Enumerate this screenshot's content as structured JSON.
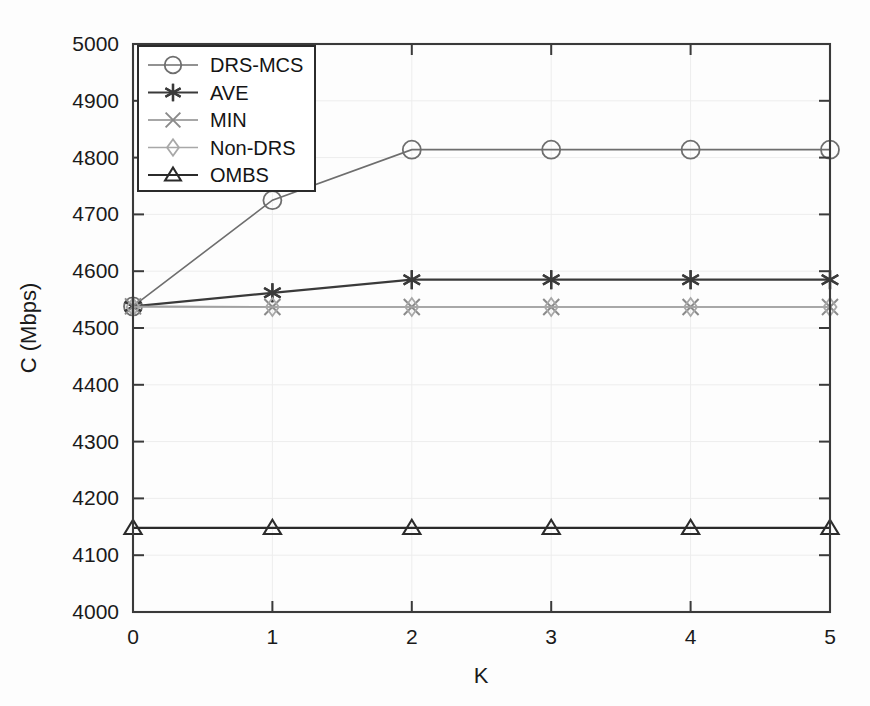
{
  "chart_data": {
    "type": "line",
    "title": "",
    "xlabel": "K",
    "ylabel": "C (Mbps)",
    "x": [
      0,
      1,
      2,
      3,
      4,
      5
    ],
    "xticklabels": [
      "0",
      "1",
      "2",
      "3",
      "4",
      "5"
    ],
    "yticklabels": [
      "4000",
      "4100",
      "4200",
      "4300",
      "4400",
      "4500",
      "4600",
      "4700",
      "4800",
      "4900",
      "5000"
    ],
    "xlim": [
      0,
      5
    ],
    "ylim": [
      4000,
      5000
    ],
    "grid": true,
    "legend_position": "upper-left",
    "series": [
      {
        "name": "DRS-MCS",
        "marker": "circle",
        "color": "#6e6e6e",
        "values": [
          4538,
          4725,
          4814,
          4814,
          4814,
          4814
        ]
      },
      {
        "name": "AVE",
        "marker": "asterisk",
        "color": "#3a3a3a",
        "values": [
          4538,
          4562,
          4585,
          4585,
          4585,
          4585
        ]
      },
      {
        "name": "MIN",
        "marker": "x",
        "color": "#8a8a8a",
        "values": [
          4538,
          4537,
          4537,
          4537,
          4537,
          4537
        ]
      },
      {
        "name": "Non-DRS",
        "marker": "diamond",
        "color": "#a8a8a8",
        "values": [
          4537,
          4537,
          4537,
          4537,
          4537,
          4537
        ]
      },
      {
        "name": "OMBS",
        "marker": "triangle",
        "color": "#2b2b2b",
        "values": [
          4148,
          4148,
          4148,
          4148,
          4148,
          4148
        ]
      }
    ]
  }
}
